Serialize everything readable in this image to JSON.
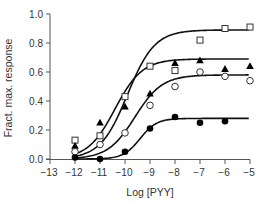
{
  "chart_data": {
    "type": "scatter",
    "title": "",
    "xlabel": "Log [PYY]",
    "ylabel": "Fract. max. response",
    "xlim": [
      -13,
      -5
    ],
    "ylim": [
      0.0,
      1.0
    ],
    "x_ticks": [
      -13,
      -12,
      -11,
      -10,
      -9,
      -8,
      -7,
      -6,
      -5
    ],
    "x_tick_labels": [
      "−13",
      "−12",
      "−11",
      "−10",
      "−9",
      "−8",
      "−7",
      "−6",
      "−5"
    ],
    "y_ticks": [
      0.0,
      0.2,
      0.4,
      0.6,
      0.8,
      1.0
    ],
    "y_tick_labels": [
      "0.0",
      "0.2",
      "0.4",
      "0.6",
      "0.8",
      "1.0"
    ],
    "grid": false,
    "legend": null,
    "x": [
      -12,
      -11,
      -10,
      -9,
      -8,
      -7,
      -6,
      -5
    ],
    "series": [
      {
        "name": "open squares",
        "marker": "square-open",
        "values": [
          0.13,
          0.16,
          0.43,
          0.64,
          0.61,
          0.82,
          0.9,
          0.91
        ],
        "fit": {
          "bottom": 0.0,
          "top": 0.89,
          "logEC50": -9.9,
          "hill": 0.8
        }
      },
      {
        "name": "filled triangles",
        "marker": "triangle-filled",
        "values": [
          0.09,
          0.25,
          0.36,
          0.45,
          0.66,
          0.68,
          0.62,
          0.64
        ],
        "fit": {
          "bottom": 0.0,
          "top": 0.69,
          "logEC50": -10.4,
          "hill": 0.8
        }
      },
      {
        "name": "open circles",
        "marker": "circle-open",
        "values": [
          0.05,
          0.1,
          0.18,
          0.37,
          0.5,
          0.6,
          0.57,
          0.54
        ],
        "fit": {
          "bottom": 0.0,
          "top": 0.58,
          "logEC50": -9.6,
          "hill": 0.8
        }
      },
      {
        "name": "filled circles",
        "marker": "circle-filled",
        "x": [
          -12,
          -11,
          -10,
          -9,
          -8,
          -7,
          -6
        ],
        "values": [
          0.01,
          0.0,
          0.05,
          0.21,
          0.29,
          0.25,
          0.26
        ],
        "fit": {
          "bottom": 0.0,
          "top": 0.28,
          "logEC50": -9.4,
          "hill": 1.3
        }
      }
    ]
  }
}
